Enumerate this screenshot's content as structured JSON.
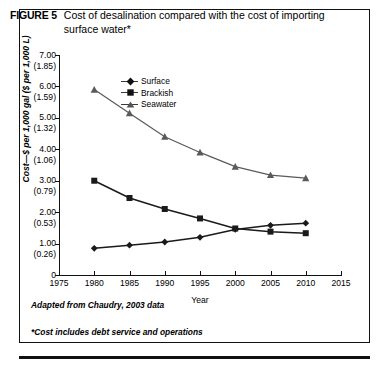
{
  "figure": {
    "label": "FIGURE 5",
    "title": "Cost of desalination compared with the cost of importing surface water*",
    "note_source": "Adapted from Chaudry, 2003 data",
    "note_footnote": "*Cost includes debt service and operations"
  },
  "chart_data": {
    "type": "line",
    "title": "Cost of desalination compared with the cost of importing surface water*",
    "xlabel": "Year",
    "ylabel": "Cost—$ per 1,000 gal ($ per 1,000 L)",
    "x": [
      1980,
      1985,
      1990,
      1995,
      2000,
      2005,
      2010
    ],
    "xlim": [
      1975,
      2015
    ],
    "ylim": [
      0,
      7
    ],
    "xticks": [
      1975,
      1980,
      1985,
      1990,
      1995,
      2000,
      2005,
      2010,
      2015
    ],
    "yticks": [
      0,
      1,
      2,
      3,
      4,
      5,
      6,
      7
    ],
    "ytick_labels": [
      {
        "primary": "0",
        "secondary": ""
      },
      {
        "primary": "1.00",
        "secondary": "(0.26)"
      },
      {
        "primary": "2.00",
        "secondary": "(0.53)"
      },
      {
        "primary": "3.00",
        "secondary": "(0.79)"
      },
      {
        "primary": "4.00",
        "secondary": "(1.06)"
      },
      {
        "primary": "5.00",
        "secondary": "(1.32)"
      },
      {
        "primary": "6.00",
        "secondary": "(1.59)"
      },
      {
        "primary": "7.00",
        "secondary": "(1.85)"
      }
    ],
    "grid": false,
    "legend_position": "upper-left-inside",
    "series": [
      {
        "name": "Surface",
        "marker": "diamond",
        "values": [
          0.85,
          0.95,
          1.05,
          1.2,
          1.45,
          1.58,
          1.65
        ]
      },
      {
        "name": "Brackish",
        "marker": "square",
        "values": [
          3.0,
          2.45,
          2.1,
          1.8,
          1.48,
          1.38,
          1.33
        ]
      },
      {
        "name": "Seawater",
        "marker": "triangle",
        "values": [
          5.9,
          5.15,
          4.4,
          3.9,
          3.45,
          3.18,
          3.08
        ]
      }
    ]
  },
  "legend": [
    {
      "label": "Surface"
    },
    {
      "label": "Brackish"
    },
    {
      "label": "Seawater"
    }
  ]
}
